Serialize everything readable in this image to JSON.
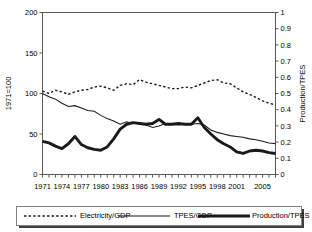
{
  "chart_data": {
    "type": "line",
    "title": "",
    "xlabel": "",
    "ylabel": "1971=100",
    "y2label": "Production/TPES",
    "grid": false,
    "legend_position": "bottom",
    "ylim": [
      0,
      200
    ],
    "y2lim": [
      0,
      1
    ],
    "yticks": [
      "0",
      "50",
      "100",
      "150",
      "200"
    ],
    "y2ticks": [
      "0",
      "0.1",
      "0.2",
      "0.3",
      "0.4",
      "0.5",
      "0.6",
      "0.7",
      "0.8",
      "0.9",
      "1"
    ],
    "x": [
      1971,
      1972,
      1973,
      1974,
      1975,
      1976,
      1977,
      1978,
      1979,
      1980,
      1981,
      1982,
      1983,
      1984,
      1985,
      1986,
      1987,
      1988,
      1989,
      1990,
      1991,
      1992,
      1993,
      1994,
      1995,
      1996,
      1997,
      1998,
      1999,
      2000,
      2001,
      2002,
      2003,
      2004,
      2005,
      2006,
      2007
    ],
    "xtick_labels": [
      "1971",
      "1974",
      "1977",
      "1980",
      "1983",
      "1986",
      "1989",
      "1992",
      "1995",
      "1998",
      "2001",
      "2005"
    ],
    "xtick_years": [
      1971,
      1974,
      1977,
      1980,
      1983,
      1986,
      1989,
      1992,
      1995,
      1998,
      2001,
      2005
    ],
    "series": [
      {
        "name": "Electricity/GDP",
        "axis": "left",
        "style": "dotted",
        "values": [
          103,
          100,
          104,
          102,
          99,
          102,
          104,
          105,
          108,
          109,
          107,
          104,
          110,
          112,
          111,
          117,
          114,
          112,
          110,
          108,
          106,
          106,
          108,
          107,
          110,
          113,
          116,
          117,
          113,
          112,
          107,
          102,
          99,
          95,
          91,
          88,
          86
        ]
      },
      {
        "name": "TPES/GDP",
        "axis": "left",
        "style": "thin",
        "values": [
          100,
          96,
          93,
          88,
          84,
          85,
          82,
          79,
          78,
          73,
          69,
          66,
          62,
          65,
          63,
          64,
          61,
          58,
          60,
          63,
          62,
          61,
          62,
          62,
          63,
          61,
          55,
          52,
          50,
          48,
          47,
          46,
          44,
          43,
          41,
          39,
          38
        ]
      },
      {
        "name": "Production/TPES",
        "axis": "right",
        "style": "thick",
        "values_left_scale": [
          41,
          39,
          35,
          32,
          38,
          47,
          37,
          33,
          31,
          30,
          34,
          44,
          56,
          62,
          64,
          63,
          62,
          63,
          68,
          62,
          62,
          63,
          62,
          62,
          70,
          58,
          50,
          43,
          38,
          34,
          28,
          26,
          29,
          30,
          29,
          27,
          26
        ],
        "values": [
          0.205,
          0.195,
          0.175,
          0.16,
          0.19,
          0.235,
          0.185,
          0.165,
          0.155,
          0.15,
          0.17,
          0.22,
          0.28,
          0.31,
          0.32,
          0.315,
          0.31,
          0.315,
          0.34,
          0.31,
          0.31,
          0.315,
          0.31,
          0.31,
          0.35,
          0.29,
          0.25,
          0.215,
          0.19,
          0.17,
          0.14,
          0.13,
          0.145,
          0.15,
          0.145,
          0.135,
          0.13
        ]
      }
    ],
    "legend": [
      {
        "label": "Electricity/GDP",
        "style": "dotted"
      },
      {
        "label": "TPES/GDP",
        "style": "thin"
      },
      {
        "label": "Production/TPES",
        "style": "thick"
      }
    ]
  }
}
